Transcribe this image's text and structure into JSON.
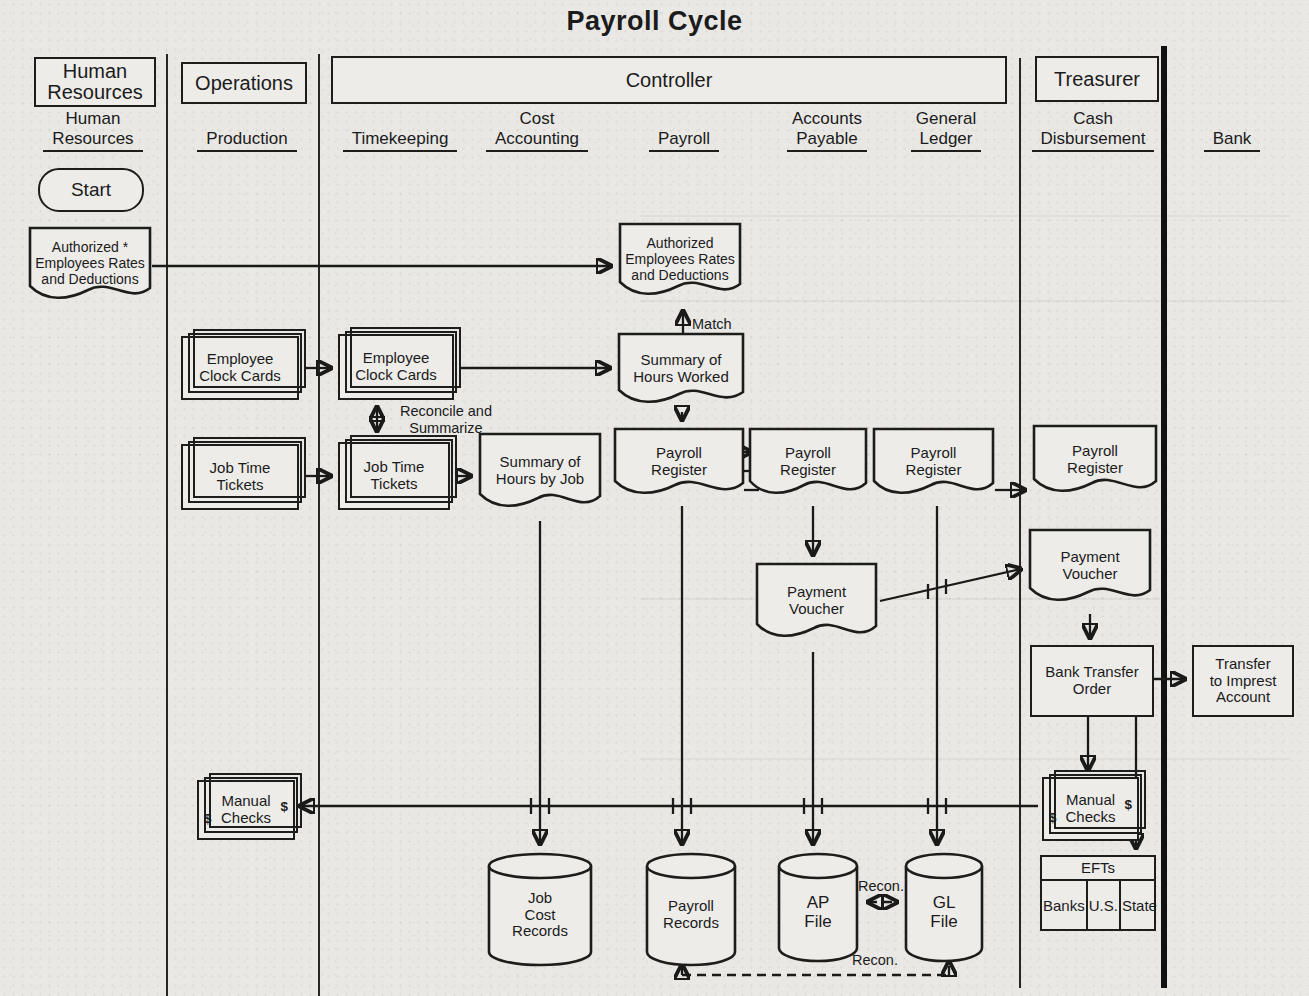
{
  "title": "Payroll Cycle",
  "groups": {
    "human_resources": "Human\nResources",
    "operations": "Operations",
    "controller": "Controller",
    "treasurer": "Treasurer"
  },
  "columns": {
    "human_resources": {
      "top": "Human",
      "bottom": "Resources"
    },
    "production": {
      "top": "",
      "bottom": "Production"
    },
    "timekeeping": {
      "top": "",
      "bottom": "Timekeeping"
    },
    "cost_accounting": {
      "top": "Cost",
      "bottom": "Accounting"
    },
    "payroll": {
      "top": "",
      "bottom": "Payroll"
    },
    "accounts_payable": {
      "top": "Accounts",
      "bottom": "Payable"
    },
    "general_ledger": {
      "top": "General",
      "bottom": "Ledger"
    },
    "cash_disbursement": {
      "top": "Cash",
      "bottom": "Disbursement"
    },
    "bank": {
      "top": "",
      "bottom": "Bank"
    }
  },
  "nodes": {
    "start": "Start",
    "hr_authorized_doc": "Authorized *\nEmployees Rates\nand Deductions",
    "payroll_authorized_doc": "Authorized\nEmployees Rates\nand Deductions",
    "employee_clock_cards_production": "Employee\nClock Cards",
    "employee_clock_cards_timekeeping": "Employee\nClock Cards",
    "job_time_tickets_production": "Job Time\nTickets",
    "job_time_tickets_timekeeping": "Job Time\nTickets",
    "summary_hours_worked": "Summary of\nHours Worked",
    "summary_hours_by_job": "Summary of\nHours by Job",
    "payroll_register_payroll": "Payroll\nRegister",
    "payroll_register_ap": "Payroll\nRegister",
    "payroll_register_gl": "Payroll\nRegister",
    "payroll_register_cd": "Payroll\nRegister",
    "payment_voucher_ap": "Payment\nVoucher",
    "payment_voucher_cd": "Payment\nVoucher",
    "bank_transfer_order": "Bank Transfer\nOrder",
    "transfer_to_imprest": "Transfer\nto Imprest\nAccount",
    "manual_checks_left": "Manual\nChecks",
    "manual_checks_cd": "Manual\nChecks",
    "dollar": "$",
    "efts": {
      "header": "EFTs",
      "cells": [
        "Banks",
        "U.S.",
        "State"
      ]
    },
    "job_cost_records": "Job\nCost\nRecords",
    "payroll_records": "Payroll\nRecords",
    "ap_file": "AP\nFile",
    "gl_file": "GL\nFile"
  },
  "edge_labels": {
    "match": "Match",
    "reconcile": "Reconcile and\nSummarize",
    "recon_top": "Recon.",
    "recon_bottom": "Recon."
  }
}
